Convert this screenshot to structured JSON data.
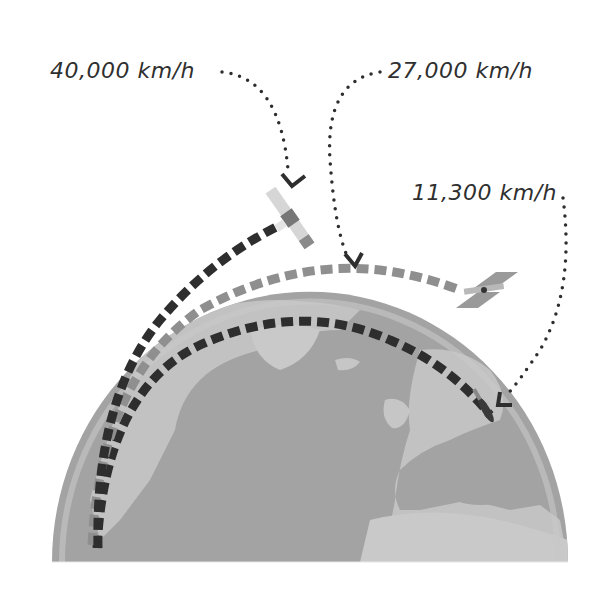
{
  "labels": {
    "speed_geo": "40,000 km/h",
    "speed_leo": "27,000 km/h",
    "speed_suborbital": "11,300 km/h"
  },
  "colors": {
    "background": "#ffffff",
    "ocean": "#9c9c9c",
    "land": "#bdbdbd",
    "atmosphere": "#c8c8c8",
    "dark_dash": "#2e2e2e",
    "light_dash": "#8f8f8f",
    "text": "#2f2f2f"
  },
  "icons": {
    "geo_satellite": "satellite-icon",
    "leo_satellite": "satellite-icon",
    "suborbital_vehicle": "rocket-icon",
    "globe": "earth-globe"
  }
}
